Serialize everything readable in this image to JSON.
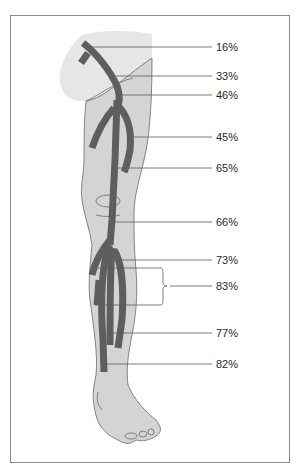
{
  "diagram": {
    "title": "",
    "colors": {
      "vein": "#5e5e5e",
      "leg_fill": "#d4d4d4",
      "thigh_highlight": "#e4e4e4",
      "outline": "#6a6a6a",
      "leader": "#5a5a5a",
      "frame": "#8a8a8a"
    },
    "labels": [
      {
        "id": "l1",
        "text": "16%",
        "y": 47
      },
      {
        "id": "l2",
        "text": "33%",
        "y": 76
      },
      {
        "id": "l3",
        "text": "46%",
        "y": 95
      },
      {
        "id": "l4",
        "text": "45%",
        "y": 137
      },
      {
        "id": "l5",
        "text": "65%",
        "y": 168
      },
      {
        "id": "l6",
        "text": "66%",
        "y": 222
      },
      {
        "id": "l7",
        "text": "73%",
        "y": 260
      },
      {
        "id": "l8",
        "text": "83%",
        "y": 286
      },
      {
        "id": "l9",
        "text": "77%",
        "y": 333
      },
      {
        "id": "l10",
        "text": "82%",
        "y": 364
      }
    ]
  }
}
